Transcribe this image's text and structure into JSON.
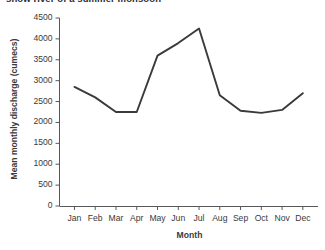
{
  "chart_data": {
    "type": "line",
    "title": "show river of a summer monsoon",
    "xlabel": "Month",
    "ylabel": "Mean monthly discharge (cumecs)",
    "categories": [
      "Jan",
      "Feb",
      "Mar",
      "Apr",
      "May",
      "Jun",
      "Jul",
      "Aug",
      "Sep",
      "Oct",
      "Nov",
      "Dec"
    ],
    "values": [
      2850,
      2600,
      2250,
      2250,
      3600,
      3900,
      4250,
      2650,
      2280,
      2230,
      2300,
      2700
    ],
    "ylim": [
      0,
      4500
    ],
    "ytick_labels": [
      "0",
      "500",
      "1000",
      "1500",
      "2000",
      "2500",
      "3000",
      "3500",
      "4000",
      "4500"
    ],
    "ytick_values": [
      0,
      500,
      1000,
      1500,
      2000,
      2500,
      3000,
      3500,
      4000,
      4500
    ],
    "grid": false,
    "legend": "none",
    "line_color": "#3a3a3a",
    "axis_color": "#55595c",
    "background_color": "#ffffff"
  }
}
